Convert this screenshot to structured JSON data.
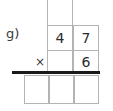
{
  "problem": {
    "label": "g)",
    "operator": "×",
    "operation": "multiplication",
    "multiplicand": "47",
    "multiplier": "6",
    "carry_row": [
      {
        "name": "carry-tens",
        "value": ""
      }
    ],
    "multiplicand_row": [
      {
        "name": "multiplicand-tens",
        "value": "4"
      },
      {
        "name": "multiplicand-ones",
        "value": "7"
      }
    ],
    "multiplier_row": [
      {
        "name": "multiplier-tens",
        "value": ""
      },
      {
        "name": "multiplier-ones",
        "value": "6"
      }
    ],
    "answer_row": [
      {
        "name": "answer-hundreds",
        "value": ""
      },
      {
        "name": "answer-tens",
        "value": ""
      },
      {
        "name": "answer-ones",
        "value": ""
      }
    ]
  },
  "colors": {
    "page_background": "#ffffff",
    "grid_line": "#b3b3b3",
    "rule_line": "#1a1a1a",
    "digit_text": "#2b2b2b",
    "label_text": "#3a3a3a"
  }
}
